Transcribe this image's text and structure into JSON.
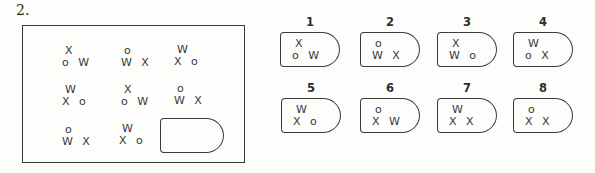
{
  "problem": {
    "label": "2."
  },
  "grid": {
    "cells": [
      {
        "top": "X",
        "bottom": "o W"
      },
      {
        "top": "o",
        "bottom": "W X"
      },
      {
        "top": "W",
        "bottom": "X o"
      },
      {
        "top": "W",
        "bottom": "X o"
      },
      {
        "top": "X",
        "bottom": "o W"
      },
      {
        "top": "o",
        "bottom": "W X"
      },
      {
        "top": "o",
        "bottom": "W X"
      },
      {
        "top": "W",
        "bottom": "X o"
      }
    ]
  },
  "options": [
    {
      "number": "1",
      "top": "X",
      "bottom": "o W"
    },
    {
      "number": "2",
      "top": "o",
      "bottom": "W X"
    },
    {
      "number": "3",
      "top": "X",
      "bottom": "W o"
    },
    {
      "number": "4",
      "top": "W",
      "bottom": "o X"
    },
    {
      "number": "5",
      "top": "W",
      "bottom": "X o"
    },
    {
      "number": "6",
      "top": "o",
      "bottom": "X W"
    },
    {
      "number": "7",
      "top": "W",
      "bottom": "X X"
    },
    {
      "number": "8",
      "top": "o",
      "bottom": "X X"
    }
  ],
  "colors": {
    "line": "#3a3a3a",
    "text": "#383838",
    "background": "#fdfdfc"
  }
}
